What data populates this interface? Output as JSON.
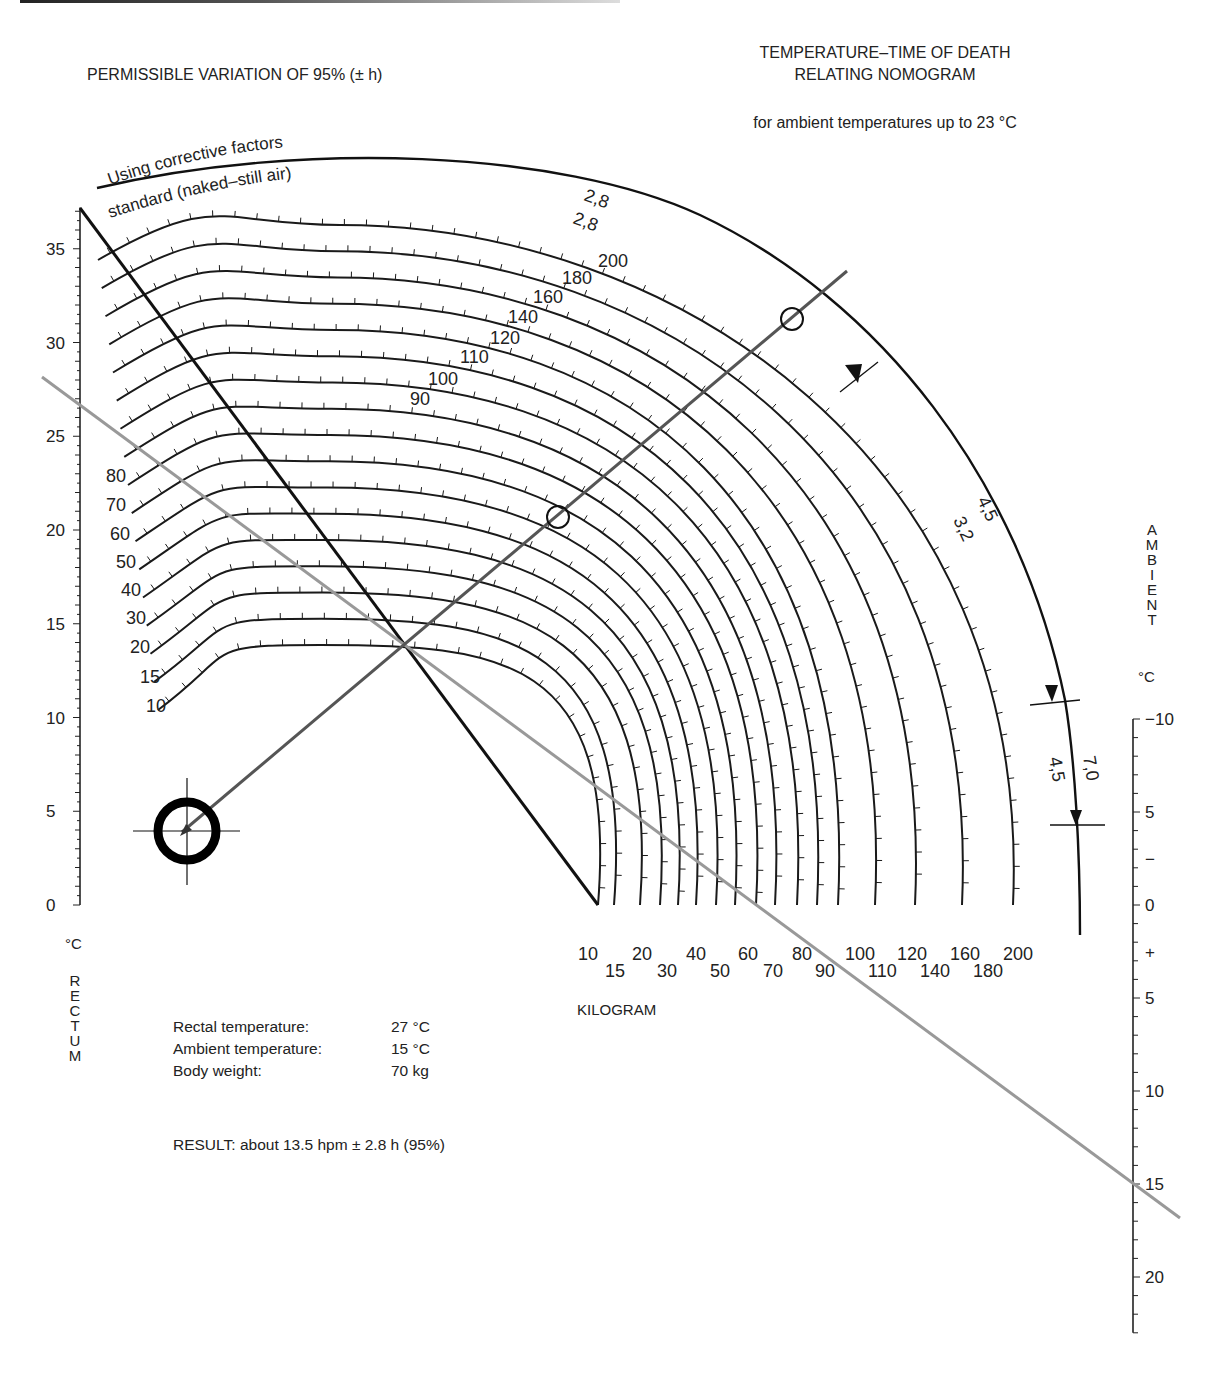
{
  "header": {
    "left_title": "PERMISSIBLE VARIATION OF 95% (± h)",
    "right_title_line1": "TEMPERATURE–TIME OF DEATH",
    "right_title_line2": "RELATING NOMOGRAM",
    "subtitle": "for ambient temperatures up to 23 °C"
  },
  "arc_labels": {
    "corrective": "Using corrective factors",
    "standard": "standard (naked–still air)"
  },
  "rectum_axis": {
    "unit": "°C",
    "label_letters": [
      "R",
      "E",
      "C",
      "T",
      "U",
      "M"
    ],
    "ticks": [
      0,
      5,
      10,
      15,
      20,
      25,
      30,
      35
    ],
    "range": [
      0,
      37
    ]
  },
  "ambient_axis": {
    "label_letters": [
      "A",
      "M",
      "B",
      "I",
      "E",
      "N",
      "T"
    ],
    "unit": "°C",
    "ticks": [
      {
        "label": "−10",
        "value": -10
      },
      {
        "label": "5",
        "value": -5
      },
      {
        "label": "−",
        "value": -2.5
      },
      {
        "label": "0",
        "value": 0
      },
      {
        "label": "+",
        "value": 2.5
      },
      {
        "label": "5",
        "value": 5
      },
      {
        "label": "10",
        "value": 10
      },
      {
        "label": "15",
        "value": 15
      },
      {
        "label": "20",
        "value": 20
      }
    ],
    "range": [
      -10,
      23
    ]
  },
  "weight_axis": {
    "label": "KILOGRAM",
    "upper_row": [
      "10",
      "20",
      "40",
      "60",
      "80",
      "100",
      "120",
      "160",
      "200"
    ],
    "lower_row": [
      "15",
      "30",
      "50",
      "70",
      "90",
      "110",
      "140",
      "180"
    ],
    "weights": [
      10,
      15,
      20,
      30,
      40,
      50,
      60,
      70,
      80,
      90,
      100,
      110,
      120,
      140,
      160,
      180,
      200
    ]
  },
  "left_weight_labels": [
    "80",
    "70",
    "60",
    "50",
    "40",
    "30",
    "20",
    "15",
    "10"
  ],
  "top_weight_labels": [
    "90",
    "100",
    "110",
    "120",
    "140",
    "160",
    "180",
    "200"
  ],
  "variation_arc": {
    "labels_top": [
      "2,8",
      "2,8"
    ],
    "labels_mid": [
      "4,5",
      "3,2"
    ],
    "labels_low": [
      "7,0",
      "4,5"
    ]
  },
  "example": {
    "rows": [
      {
        "label": "Rectal temperature:",
        "value": "27 °C"
      },
      {
        "label": "Ambient temperature:",
        "value": "15 °C"
      },
      {
        "label": "Body weight:",
        "value": "70 kg"
      }
    ],
    "result": "RESULT: about 13.5 hpm ± 2.8 h (95%)"
  },
  "chart_data": {
    "type": "nomogram",
    "title": "TEMPERATURE–TIME OF DEATH RELATING NOMOGRAM",
    "subtitle": "for ambient temperatures up to 23 °C",
    "axes": {
      "rectal_temperature_C": {
        "min": 0,
        "max": 37,
        "major_ticks": [
          0,
          5,
          10,
          15,
          20,
          25,
          30,
          35
        ],
        "position": "left"
      },
      "ambient_temperature_C": {
        "min": -10,
        "max": 23,
        "major_ticks": [
          -10,
          -5,
          0,
          5,
          10,
          15,
          20
        ],
        "position": "right"
      },
      "body_weight_kg": {
        "curves": [
          10,
          15,
          20,
          30,
          40,
          50,
          60,
          70,
          80,
          90,
          100,
          110,
          120,
          140,
          160,
          180,
          200
        ],
        "position": "bottom arcs"
      }
    },
    "curve_hour_ticks_examples": {
      "10kg": [
        1,
        2,
        4,
        5,
        6,
        7,
        8,
        10
      ],
      "70kg_outer_right": [
        10,
        12,
        14,
        16,
        18,
        20,
        22,
        24,
        26,
        28,
        30,
        35,
        40
      ],
      "200kg": [
        10,
        15,
        20,
        24,
        28,
        32,
        36,
        40,
        44,
        48,
        52,
        56,
        60,
        65,
        70,
        75,
        80
      ]
    },
    "permissible_variation_95pct_h": {
      "standard": [
        2.8,
        3.2,
        4.5
      ],
      "corrective_factors": [
        2.8,
        4.5,
        7.0
      ]
    },
    "example_reading": {
      "rectal_temperature_C": 27,
      "ambient_temperature_C": 15,
      "body_weight_kg": 70,
      "result_hpm": 13.5,
      "variation_h": 2.8,
      "confidence": "95%"
    },
    "legend": []
  }
}
